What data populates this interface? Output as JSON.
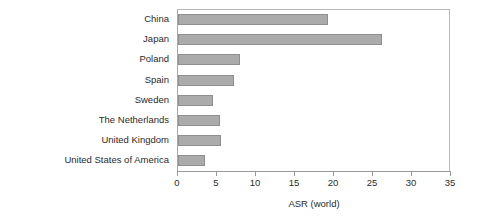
{
  "chart_data": {
    "type": "bar",
    "orientation": "horizontal",
    "title": "",
    "xlabel": "ASR (world)",
    "ylabel": "",
    "xlim": [
      0,
      35
    ],
    "xticks": [
      0,
      5,
      10,
      15,
      20,
      25,
      30,
      35
    ],
    "xtick_labels": [
      "0",
      "5",
      "10",
      "15",
      "20",
      "25",
      "30",
      "35"
    ],
    "grid": false,
    "legend": null,
    "categories": [
      "China",
      "Japan",
      "Poland",
      "Spain",
      "Sweden",
      "The Netherlands",
      "United Kingdom",
      "United States of America"
    ],
    "values": [
      19.2,
      26.2,
      7.9,
      7.2,
      4.5,
      5.4,
      5.5,
      3.5
    ],
    "bar_color": "#ababab",
    "bar_edge_color": "#8f8f8f",
    "axis_color": "#9a9a9a",
    "text_color": "#2b2b2b",
    "background_color": "#ffffff"
  }
}
